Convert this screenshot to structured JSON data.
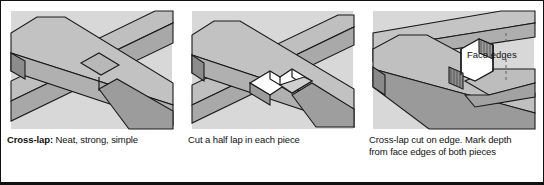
{
  "figure": {
    "panel_count": 3,
    "colors": {
      "background": "#ffffff",
      "border": "#111111",
      "art_background": "#d8d8d8",
      "board_face": "#b3b3b3",
      "board_face_light": "#c6c6c6",
      "board_edge_dark": "#8a8a8a",
      "board_shadow": "#9a9a9a",
      "outline": "#1a1a1a",
      "text": "#111111",
      "leader_line": "#555555"
    }
  },
  "panels": [
    {
      "id": "panel-cross-lap-finished",
      "caption_lead": "Cross-lap:",
      "caption_rest": " Neat, strong, simple",
      "caption_lines": [
        "Cross-lap: Neat, strong, simple"
      ]
    },
    {
      "id": "panel-half-lap-cut",
      "caption_lead": "",
      "caption_rest": "Cut a half lap in each piece",
      "caption_lines": [
        "Cut a half lap in each piece"
      ]
    },
    {
      "id": "panel-cross-lap-on-edge",
      "caption_lead": "",
      "caption_rest": "Cross-lap cut on edge. Mark depth from face edges of both pieces",
      "caption_lines": [
        "Cross-lap cut on edge. Mark depth",
        "from face edges of both pieces"
      ],
      "callout": "Face edges"
    }
  ]
}
